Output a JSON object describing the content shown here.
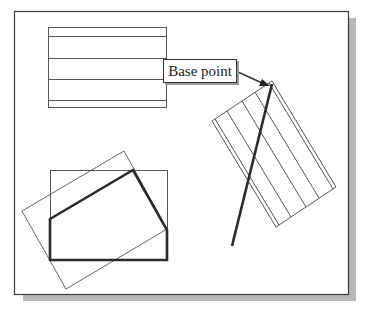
{
  "diagram": {
    "annotation": {
      "label": "Base point"
    },
    "colors": {
      "frame": "#3a3a3a",
      "shadow": "#b5b5b5",
      "thin_line": "#555555",
      "thick_line": "#2a2a2a",
      "background": "#ffffff"
    },
    "frame": {
      "x": 14,
      "y": 11,
      "width": 334,
      "height": 283
    },
    "groups": [
      {
        "name": "original-rectangle-with-lines",
        "description": "Upright rectangle with horizontal lines"
      },
      {
        "name": "rotated-rectangle-with-lines",
        "description": "Rotated copy with base point at top corner and a thick line"
      },
      {
        "name": "polygon-group",
        "description": "Upright rectangle, thick polygon, and rotated thin rectangle"
      }
    ]
  }
}
